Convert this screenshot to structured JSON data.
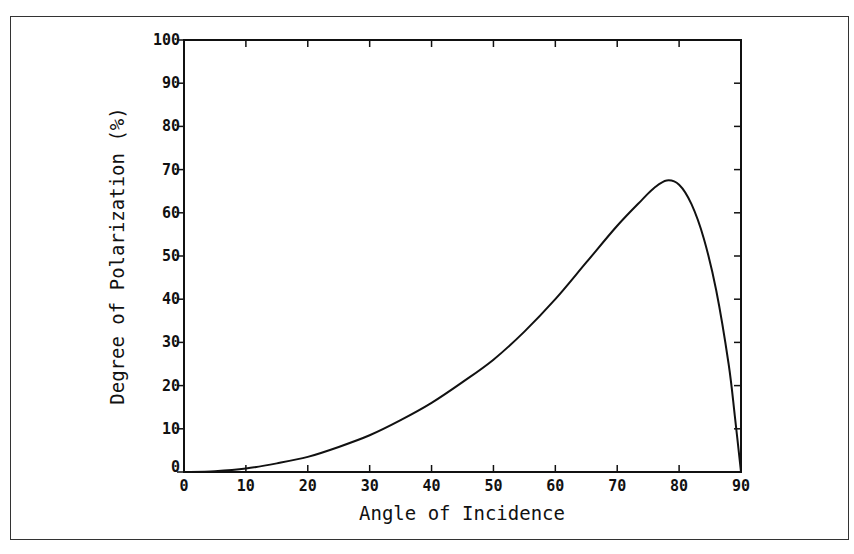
{
  "chart_data": {
    "type": "line",
    "title": "",
    "xlabel": "Angle of Incidence",
    "ylabel": "Degree of Polarization (%)",
    "xlim": [
      0,
      90
    ],
    "ylim": [
      0,
      100
    ],
    "xticks": [
      0,
      10,
      20,
      30,
      40,
      50,
      60,
      70,
      80,
      90
    ],
    "yticks": [
      0,
      10,
      20,
      30,
      40,
      50,
      60,
      70,
      80,
      90,
      100
    ],
    "xtick_labels": [
      "0",
      "10",
      "20",
      "30",
      "40",
      "50",
      "60",
      "70",
      "80",
      "90"
    ],
    "ytick_labels": [
      "0",
      "10",
      "20",
      "30",
      "40",
      "50",
      "60",
      "70",
      "80",
      "90",
      "100"
    ],
    "grid": false,
    "legend": null,
    "series": [
      {
        "name": "Degree of Polarization",
        "x": [
          0,
          5,
          10,
          15,
          20,
          25,
          30,
          35,
          40,
          45,
          50,
          55,
          60,
          65,
          70,
          74,
          76,
          78,
          80,
          82,
          84,
          86,
          88,
          89,
          90
        ],
        "y": [
          0,
          0.2,
          0.8,
          2.0,
          3.5,
          5.8,
          8.5,
          12.0,
          16.0,
          20.8,
          26.0,
          32.5,
          40.0,
          48.5,
          57.0,
          63.0,
          65.8,
          67.5,
          66.5,
          62.0,
          54.0,
          42.0,
          25.0,
          13.0,
          0
        ]
      }
    ],
    "colors": {
      "line": "#111111",
      "axes": "#111111",
      "background": "#ffffff"
    }
  }
}
